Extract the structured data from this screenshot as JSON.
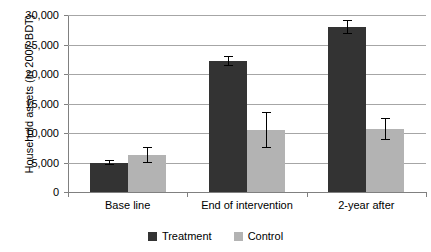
{
  "chart_data": {
    "type": "bar",
    "title": "",
    "xlabel": "",
    "ylabel": "Household assets (in 2007 BDT)",
    "categories": [
      "Base line",
      "End of intervention",
      "2-year after"
    ],
    "series": [
      {
        "name": "Treatment",
        "color": "#333333",
        "values": [
          5000,
          22200,
          28000
        ],
        "errors": [
          400,
          800,
          1200
        ]
      },
      {
        "name": "Control",
        "color": "#b3b3b3",
        "values": [
          6300,
          10500,
          10700
        ],
        "errors": [
          1400,
          3100,
          1900
        ]
      }
    ],
    "ylim": [
      0,
      30000
    ],
    "yticks": [
      0,
      5000,
      10000,
      15000,
      20000,
      25000,
      30000
    ],
    "ytick_labels": [
      "0",
      "5,000",
      "10,000",
      "15,000",
      "20,000",
      "25,000",
      "30,000"
    ],
    "grid": true,
    "legend_position": "bottom",
    "error_bar_style": "capped"
  }
}
